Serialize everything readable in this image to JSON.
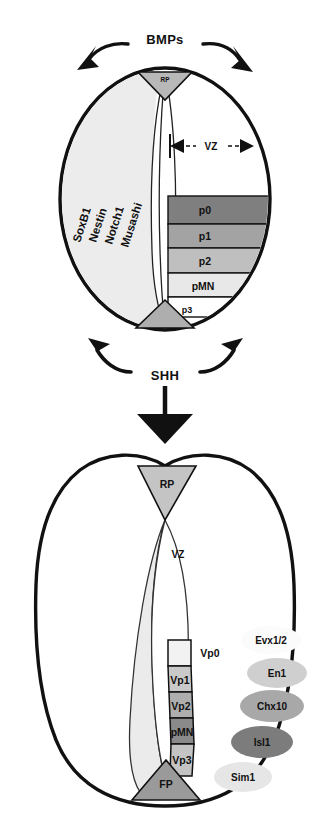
{
  "figure": {
    "panels": [
      {
        "id": "top",
        "name": "early-neural-tube",
        "signals": {
          "dorsal": "BMPs",
          "ventral": "SHH"
        },
        "zone_label": "VZ",
        "roof_plate": "RP",
        "floor_plate": "FP",
        "floor_plate_label": "p3",
        "progenitor_genes": [
          "SoxB1",
          "Nestin",
          "Notch1",
          "Musashi"
        ],
        "domains": [
          {
            "label": "p0",
            "color": "#7f7f7f"
          },
          {
            "label": "p1",
            "color": "#a3a3a3"
          },
          {
            "label": "p2",
            "color": "#bfbfbf"
          },
          {
            "label": "pMN",
            "color": "#e2e2e2"
          },
          {
            "label": "p3",
            "color": "#ffffff"
          }
        ]
      },
      {
        "id": "bottom",
        "name": "differentiated-neural-tube",
        "roof_plate": "RP",
        "floor_plate": "FP",
        "zone_label": "VZ",
        "domains": [
          {
            "label": "Vp0",
            "color": "#f2f2f2"
          },
          {
            "label": "Vp1",
            "color": "#c9c9c9"
          },
          {
            "label": "Vp2",
            "color": "#aeaeae"
          },
          {
            "label": "pMN",
            "color": "#8a8a8a"
          },
          {
            "label": "Vp3",
            "color": "#c4c4c4"
          }
        ],
        "markers": [
          {
            "label": "Evx1/2",
            "color": "#fbfbfb"
          },
          {
            "label": "En1",
            "color": "#cfcfcf"
          },
          {
            "label": "Chx10",
            "color": "#a8a8a8"
          },
          {
            "label": "Isl1",
            "color": "#7c7c7c"
          },
          {
            "label": "Sim1",
            "color": "#e6e6e6"
          }
        ]
      }
    ],
    "colors": {
      "outline": "#111111",
      "roof_plate": "#c4c4c4",
      "floor_plate": "#9a9a9a",
      "ventricular_zone": "#ededed",
      "background": "#ffffff"
    }
  }
}
